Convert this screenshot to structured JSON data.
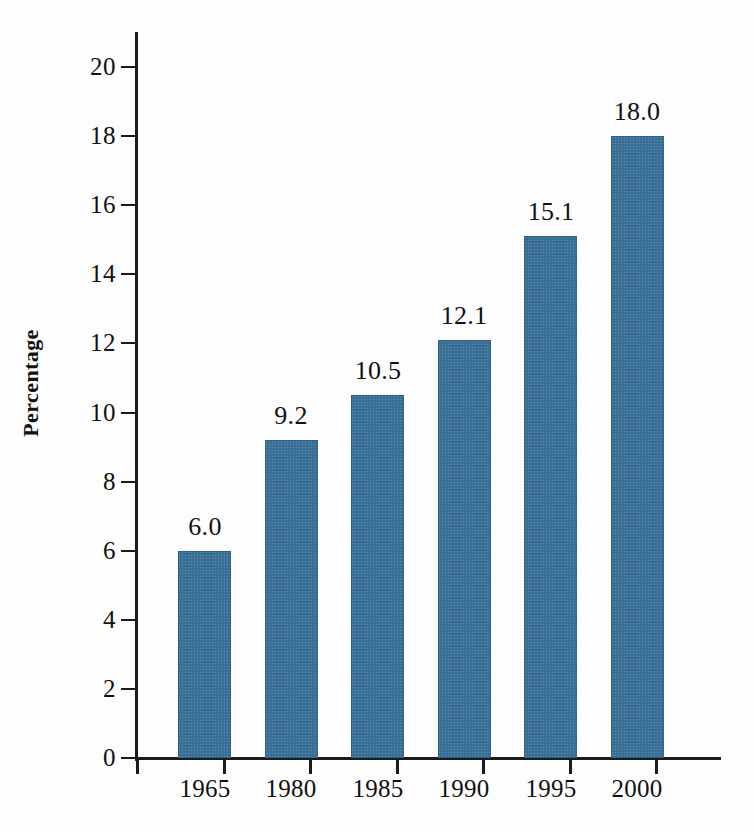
{
  "chart_data": {
    "type": "bar",
    "title": "",
    "subtitle": "",
    "xlabel": "",
    "ylabel": "Percentage",
    "categories": [
      "1965",
      "1980",
      "1985",
      "1990",
      "1995",
      "2000"
    ],
    "values": [
      6.0,
      9.2,
      10.5,
      12.1,
      15.1,
      18.0
    ],
    "value_labels": [
      "6.0",
      "9.2",
      "10.5",
      "12.1",
      "15.1",
      "18.0"
    ],
    "ylim": [
      0,
      20
    ],
    "ytick_labels": [
      "0",
      "2",
      "4",
      "6",
      "8",
      "10",
      "12",
      "14",
      "16",
      "18",
      "20"
    ],
    "ytick_values": [
      0,
      2,
      4,
      6,
      8,
      10,
      12,
      14,
      16,
      18,
      20
    ],
    "grid": false,
    "legend": "none",
    "series_color": "#3a7298",
    "axis_color": "#1b1b1b"
  }
}
